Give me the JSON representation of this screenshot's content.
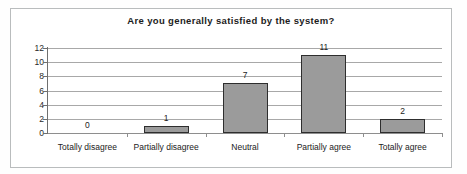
{
  "chart_data": {
    "type": "bar",
    "title": "Are you generally satisfied by the system?",
    "xlabel": "",
    "ylabel": "",
    "categories": [
      "Totally disagree",
      "Partially disagree",
      "Neutral",
      "Partially agree",
      "Totally agree"
    ],
    "values": [
      0,
      1,
      7,
      11,
      2
    ],
    "data_labels": [
      "0",
      "1",
      "7",
      "11",
      "2"
    ],
    "ylim": [
      0,
      12
    ],
    "yticks": [
      0,
      2,
      4,
      6,
      8,
      10,
      12
    ],
    "ytick_labels": [
      "0",
      "2",
      "4",
      "6",
      "8",
      "10",
      "12"
    ],
    "grid": "horizontal",
    "legend": "none",
    "series_color": "#9b9b9b",
    "series_border_color": "#2e2e2e",
    "gridline_color": "#a8a8a8",
    "axis_color": "#6f6f6f",
    "frame_color": "#b9bcbd",
    "background_color": "#ffffff",
    "text_color": "#222222"
  }
}
